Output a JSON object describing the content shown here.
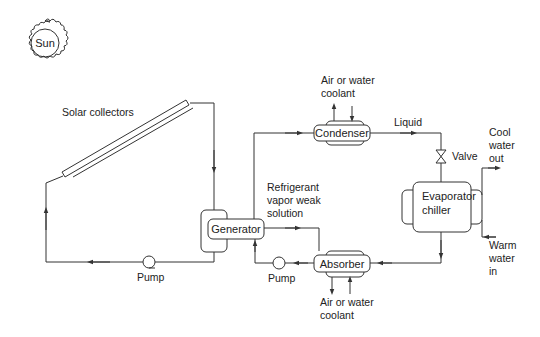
{
  "diagram": {
    "sun": {
      "label": "Sun"
    },
    "labels": {
      "solar_collectors": "Solar collectors",
      "condenser_coolant_line1": "Air or water",
      "condenser_coolant_line2": "coolant",
      "liquid": "Liquid",
      "valve": "Valve",
      "cool_water_out_line1": "Cool",
      "cool_water_out_line2": "water",
      "cool_water_out_line3": "out",
      "refrigerant_line1": "Refrigerant",
      "refrigerant_line2": "vapor weak",
      "refrigerant_line3": "solution",
      "warm_water_in_line1": "Warm",
      "warm_water_in_line2": "water",
      "warm_water_in_line3": "in",
      "pump_left": "Pump",
      "pump_right": "Pump",
      "absorber_coolant_line1": "Air or water",
      "absorber_coolant_line2": "coolant"
    },
    "components": {
      "generator": "Generator",
      "condenser": "Condenser",
      "absorber": "Absorber",
      "evaporator_line1": "Evaporator",
      "evaporator_line2": "chiller"
    },
    "colors": {
      "line": "#333333",
      "text": "#222222",
      "background": "#ffffff"
    }
  }
}
